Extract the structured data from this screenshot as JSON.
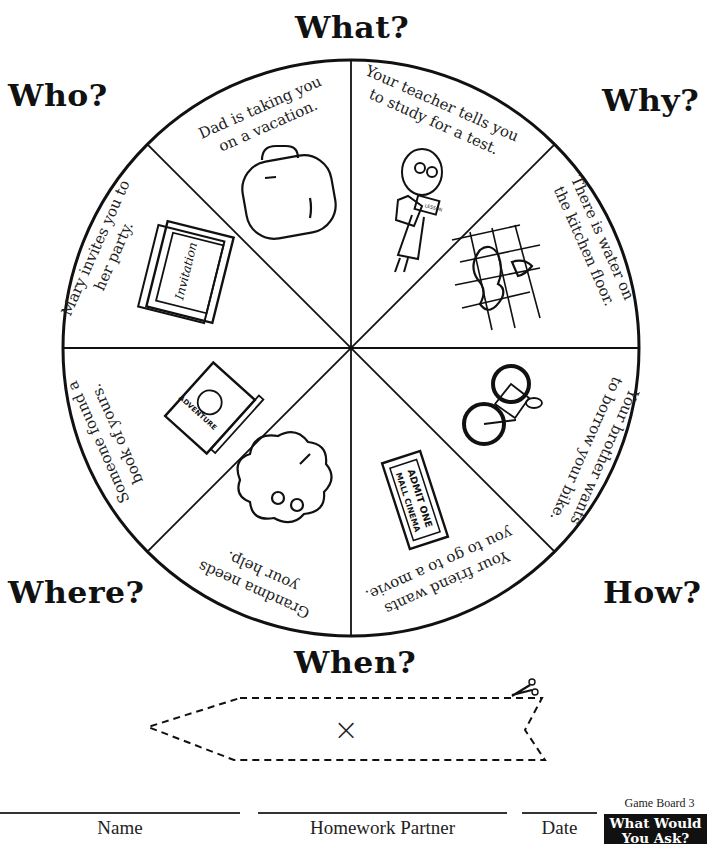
{
  "board": {
    "questions": {
      "top": "What?",
      "top_left": "Who?",
      "top_right": "Why?",
      "bottom_left": "Where?",
      "bottom_right": "How?",
      "bottom": "When?"
    },
    "segments": [
      {
        "id": "vacation",
        "line1": "Dad is taking you",
        "line2": "on a vacation.",
        "icon": "suitcase-icon"
      },
      {
        "id": "teacher",
        "line1": "Your teacher tells you",
        "line2": "to study for a test.",
        "icon": "teacher-icon",
        "icon_text": "LESSON"
      },
      {
        "id": "water",
        "line1": "There is water on",
        "line2": "the kitchen floor.",
        "icon": "water-puddle-icon"
      },
      {
        "id": "bike",
        "line1": "Your brother wants",
        "line2": "to borrow your bike.",
        "icon": "bicycle-icon"
      },
      {
        "id": "movie",
        "line1": "Your friend wants",
        "line2": "you to go to a movie.",
        "icon": "movie-ticket-icon",
        "icon_text_1": "ADMIT ONE",
        "icon_text_2": "MALL CINEMA"
      },
      {
        "id": "grandma",
        "line1": "Grandma needs",
        "line2": "your help.",
        "icon": "grandma-icon"
      },
      {
        "id": "book",
        "line1": "Someone found a",
        "line2": "book of yours.",
        "icon": "adventure-book-icon",
        "icon_text": "ADVENTURE"
      },
      {
        "id": "party",
        "line1": "Mary invites you to",
        "line2": "her party.",
        "icon": "invitation-icon",
        "icon_text": "Invitation"
      }
    ],
    "spinner": {
      "center_mark": "×",
      "cut_icon": "scissors-icon"
    }
  },
  "footer": {
    "name_label": "Name",
    "partner_label": "Homework Partner",
    "date_label": "Date",
    "game_board": "Game Board 3",
    "badge_line1": "What Would",
    "badge_line2": "You Ask?"
  }
}
